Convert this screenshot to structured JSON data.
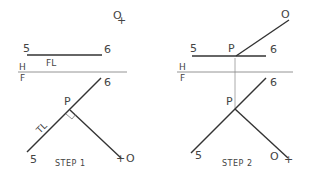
{
  "step1": {
    "title": "STEP 1",
    "top_view": {
      "label_5": "5",
      "label_6": "6",
      "label_fl": "FL",
      "label_o": "O",
      "plus": "+"
    },
    "fold_line": {
      "label_h": "H",
      "label_f": "F"
    },
    "front_view": {
      "label_6": "6",
      "label_p": "P",
      "label_5": "5",
      "label_tl": "TL",
      "label_o": "O",
      "plus": "+"
    }
  },
  "step2": {
    "title": "STEP 2",
    "top_view": {
      "label_5": "5",
      "label_p": "P",
      "label_6": "6",
      "label_o": "O"
    },
    "fold_line": {
      "label_h": "H",
      "label_f": "F"
    },
    "front_view": {
      "label_6": "6",
      "label_p": "P",
      "label_5": "5",
      "label_o": "O",
      "plus": "+"
    }
  },
  "colors": {
    "line": "#333333",
    "fold_line": "#888888",
    "projector": "#aaaaaa"
  }
}
